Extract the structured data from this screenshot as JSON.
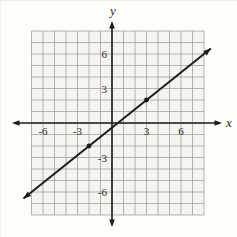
{
  "chart_data": {
    "type": "line",
    "title": "",
    "xlabel": "x",
    "ylabel": "y",
    "x_range": [
      -7,
      8
    ],
    "y_range": [
      -8,
      8
    ],
    "grid": true,
    "legend": "none",
    "x_tick_values": [
      -6,
      -3,
      3,
      6
    ],
    "x_tick_labels": [
      "-6",
      "-3",
      "3",
      "6"
    ],
    "y_tick_values": [
      6,
      3,
      -3,
      -6
    ],
    "y_tick_labels": [
      "6",
      "3",
      "-3",
      "-6"
    ],
    "series": [
      {
        "name": "line-through-points",
        "slope": 0.8,
        "y_intercept": -0.4,
        "marked_points": [
          [
            -2,
            -2
          ],
          [
            3,
            2
          ]
        ],
        "segment_x_extent": [
          -7.7,
          8.6
        ],
        "arrowheads": "both"
      }
    ],
    "colors": {
      "axis": "#1b1b1b",
      "line": "#1b1b1b",
      "point": "#1b1b1b",
      "grid": "#9c9c99",
      "label": "#2a2a28",
      "plot_background": "#f5f4f0",
      "page_background": "#fdfdfa"
    }
  }
}
